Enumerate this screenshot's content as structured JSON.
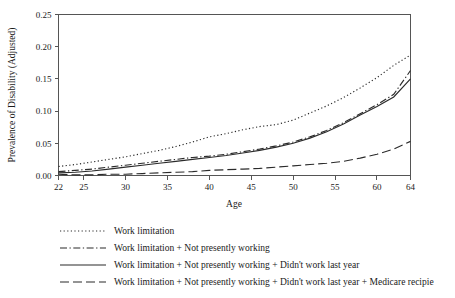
{
  "chart_data": {
    "type": "line",
    "title": "",
    "xlabel": "Age",
    "ylabel": "Prevalence of Disability (Adjusted)",
    "xlim": [
      22,
      64
    ],
    "ylim": [
      0.0,
      0.25
    ],
    "grid": false,
    "legend_position": "below",
    "xticks": [
      22,
      25,
      30,
      35,
      40,
      45,
      50,
      55,
      60,
      64
    ],
    "xtick_labels": [
      "22",
      "25",
      "30",
      "35",
      "40",
      "45",
      "50",
      "55",
      "60",
      "64"
    ],
    "yticks": [
      0.0,
      0.05,
      0.1,
      0.15,
      0.2,
      0.25
    ],
    "ytick_labels": [
      "0.00",
      "0.05",
      "0.10",
      "0.15",
      "0.20",
      "0.25"
    ],
    "x": [
      22,
      24,
      26,
      28,
      30,
      32,
      34,
      36,
      38,
      40,
      42,
      44,
      46,
      48,
      50,
      52,
      54,
      56,
      58,
      60,
      62,
      64
    ],
    "series": [
      {
        "name": "Work limitation",
        "style": "dotted",
        "values": [
          0.014,
          0.017,
          0.021,
          0.025,
          0.029,
          0.034,
          0.039,
          0.045,
          0.052,
          0.06,
          0.065,
          0.071,
          0.076,
          0.079,
          0.086,
          0.097,
          0.108,
          0.121,
          0.136,
          0.152,
          0.171,
          0.187
        ]
      },
      {
        "name": "Work limitation + Not presently working",
        "style": "dash-dot",
        "values": [
          0.006,
          0.008,
          0.01,
          0.013,
          0.016,
          0.019,
          0.022,
          0.025,
          0.028,
          0.03,
          0.033,
          0.037,
          0.041,
          0.046,
          0.052,
          0.06,
          0.07,
          0.082,
          0.096,
          0.11,
          0.126,
          0.163
        ]
      },
      {
        "name": "Work limitation + Not presently working + Didn't work last year",
        "style": "solid",
        "values": [
          0.004,
          0.005,
          0.007,
          0.01,
          0.013,
          0.016,
          0.019,
          0.022,
          0.025,
          0.028,
          0.031,
          0.035,
          0.039,
          0.044,
          0.05,
          0.058,
          0.068,
          0.08,
          0.094,
          0.107,
          0.122,
          0.15
        ]
      },
      {
        "name": "Work limitation + Not presently working + Didn't work last year + Medicare recipie",
        "style": "long-dash",
        "values": [
          0.002,
          0.001,
          0.001,
          0.002,
          0.002,
          0.003,
          0.004,
          0.005,
          0.006,
          0.008,
          0.009,
          0.01,
          0.011,
          0.013,
          0.015,
          0.017,
          0.019,
          0.022,
          0.027,
          0.033,
          0.041,
          0.053
        ]
      }
    ]
  },
  "legend": {
    "items": [
      {
        "label": "Work limitation"
      },
      {
        "label": "Work limitation + Not presently working"
      },
      {
        "label": "Work limitation + Not presently working + Didn't work last year"
      },
      {
        "label": "Work limitation + Not presently working + Didn't work last year + Medicare recipie"
      }
    ]
  },
  "colors": {
    "ink": "#2b2b2b",
    "axis": "#555555",
    "background": "#ffffff"
  }
}
